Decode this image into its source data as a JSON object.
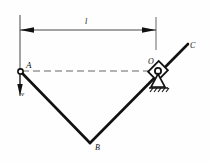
{
  "figure": {
    "type": "mechanism-kinematics-diagram",
    "background": "#fefefe",
    "stroke_color": "#111111",
    "dashed_color": "#555555",
    "labels": {
      "point_a": "A",
      "point_b": "B",
      "point_c": "C",
      "point_o": "O",
      "dimension_l": "l",
      "velocity_v": "v"
    },
    "points": {
      "A": {
        "x": 20,
        "y": 71
      },
      "B": {
        "x": 90,
        "y": 143
      },
      "O": {
        "x": 158,
        "y": 71
      },
      "C": {
        "x": 188,
        "y": 44
      }
    },
    "members": [
      {
        "name": "link-AB",
        "from": "A",
        "to": "B"
      },
      {
        "name": "link-BC",
        "from": "B",
        "to": "C"
      }
    ],
    "supports": {
      "pin_at_a": "pin-joint",
      "roller_at_o": "roller-support-hatched-ground"
    },
    "dimension_line": {
      "label": "l",
      "y": 30,
      "x_start": 20,
      "x_end": 156,
      "arrow_left": true,
      "arrow_right": true
    },
    "reference_line": {
      "name": "dashed-centerline-A-O",
      "style": "dashed",
      "from": "A",
      "to": "O"
    },
    "velocity_arrow": {
      "label": "v",
      "direction": "down",
      "at": "A"
    }
  }
}
